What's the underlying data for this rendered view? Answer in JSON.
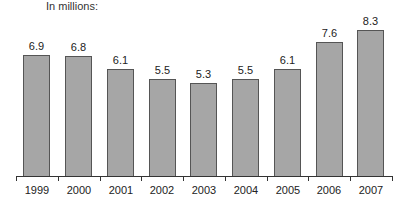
{
  "chart_data": {
    "type": "bar",
    "title": "",
    "subtitle": "In millions:",
    "xlabel": "",
    "ylabel": "",
    "categories": [
      "1999",
      "2000",
      "2001",
      "2002",
      "2003",
      "2004",
      "2005",
      "2006",
      "2007"
    ],
    "values": [
      6.9,
      6.8,
      6.1,
      5.5,
      5.3,
      5.5,
      6.1,
      7.6,
      8.3
    ],
    "value_labels": [
      "6.9",
      "6.8",
      "6.1",
      "5.5",
      "5.3",
      "5.5",
      "6.1",
      "7.6",
      "8.3"
    ],
    "ylim": [
      0,
      8.5
    ],
    "grid": false,
    "legend": null,
    "bar_color": "#a6a6a6",
    "bar_edge_color": "#555555"
  }
}
